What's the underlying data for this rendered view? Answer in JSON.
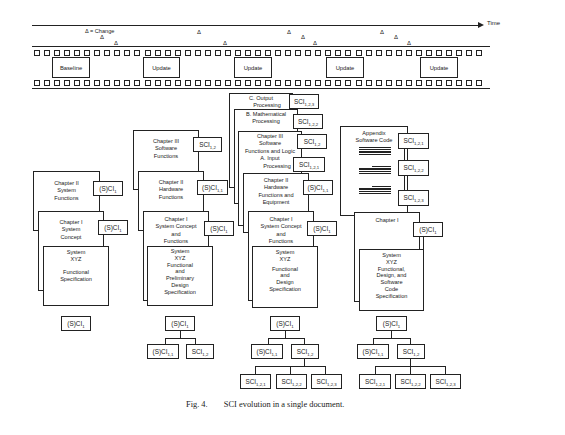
{
  "timeline": {
    "axis_label": "Time",
    "legend": "Δ = Change",
    "change_marker": "Δ",
    "frames": [
      {
        "label": "Baseline"
      },
      {
        "label": "Update"
      },
      {
        "label": "Update"
      },
      {
        "label": "Update"
      },
      {
        "label": "Update"
      }
    ]
  },
  "columns": [
    {
      "id": "baseline",
      "pages": [
        {
          "title": "Chapter II",
          "lines": [
            "System",
            "Functions"
          ],
          "sci": "(S)CI",
          "sub": "1"
        },
        {
          "title": "Chapter I",
          "lines": [
            "System",
            "Concept"
          ],
          "sci": "(S)CI",
          "sub": "1"
        },
        {
          "title": "System",
          "lines": [
            "XYZ",
            "",
            "Functional",
            "Specification"
          ]
        }
      ],
      "tree": {
        "root": {
          "label": "(S)CI",
          "sub": "1"
        }
      }
    },
    {
      "id": "update1",
      "pages": [
        {
          "title": "Chapter III",
          "lines": [
            "Software",
            "Functions"
          ],
          "sci": "SCI",
          "sub": "1,2"
        },
        {
          "title": "Chapter II",
          "lines": [
            "Hardware",
            "Functions"
          ],
          "sci": "(S)CI",
          "sub": "1,1"
        },
        {
          "title": "Chapter I",
          "lines": [
            "System Concept",
            "and",
            "Functions"
          ],
          "sci": "(S)CI",
          "sub": "1"
        },
        {
          "title": "System",
          "lines": [
            "XYZ",
            "Functional",
            "and",
            "Preliminary",
            "Design",
            "Specification"
          ]
        }
      ],
      "tree": {
        "root": {
          "label": "(S)CI",
          "sub": "1"
        },
        "children": [
          {
            "label": "(S)CI",
            "sub": "1,1"
          },
          {
            "label": "SCI",
            "sub": "1,2"
          }
        ]
      }
    },
    {
      "id": "update2",
      "pages": [
        {
          "title": "C. Output",
          "lines": [
            "Processing"
          ],
          "sci": "SCI",
          "sub": "1,2,3"
        },
        {
          "title": "B. Mathematical",
          "lines": [
            "Processing"
          ],
          "sci": "SCI",
          "sub": "1,2,2"
        },
        {
          "title": "Chapter III",
          "lines": [
            "Software",
            "Functions and Logic"
          ],
          "sci": "SCI",
          "sub": "1,2"
        },
        {
          "title": "A. Input",
          "lines": [
            "Processing"
          ],
          "sci": "SCI",
          "sub": "1,2,1"
        },
        {
          "title": "Chapter II",
          "lines": [
            "Hardware",
            "Functions and",
            "Equipment"
          ],
          "sci": "(S)CI",
          "sub": "1,1"
        },
        {
          "title": "Chapter I",
          "lines": [
            "System Concept",
            "and",
            "Functions"
          ],
          "sci": "(S)CI",
          "sub": "1"
        },
        {
          "title": "System",
          "lines": [
            "XYZ",
            "",
            "Functional",
            "and",
            "Design",
            "Specification"
          ]
        }
      ],
      "tree": {
        "root": {
          "label": "(S)CI",
          "sub": "1"
        },
        "children": [
          {
            "label": "(S)CI",
            "sub": "1,1"
          },
          {
            "label": "SCI",
            "sub": "1,2"
          }
        ],
        "grandchildren": [
          {
            "label": "SCI",
            "sub": "1,2,1"
          },
          {
            "label": "SCI",
            "sub": "1,2,2"
          },
          {
            "label": "SCI",
            "sub": "1,2,3"
          }
        ]
      }
    },
    {
      "id": "update3",
      "pages": [
        {
          "title": "Appendix",
          "lines": [
            "Software Code"
          ],
          "sci_list": [
            {
              "label": "SCI",
              "sub": "1,2,1"
            },
            {
              "label": "SCI",
              "sub": "1,2,2"
            },
            {
              "label": "SCI",
              "sub": "1,2,3"
            }
          ]
        },
        {
          "title": "Chapter I",
          "lines": [],
          "sci": "(S)CI",
          "sub": "1"
        },
        {
          "title": "System",
          "lines": [
            "XYZ",
            "Functional,",
            "Design, and",
            "Software",
            "Code",
            "Specification"
          ]
        }
      ],
      "tree": {
        "root": {
          "label": "(S)CI",
          "sub": "1"
        },
        "children": [
          {
            "label": "(S)CI",
            "sub": "1,1"
          },
          {
            "label": "SCI",
            "sub": "1,2"
          }
        ],
        "grandchildren": [
          {
            "label": "SCI",
            "sub": "1,2,1"
          },
          {
            "label": "SCI",
            "sub": "1,2,2"
          },
          {
            "label": "SCI",
            "sub": "1,2,3"
          }
        ]
      }
    }
  ],
  "caption": {
    "fig": "Fig. 4.",
    "text": "SCI evolution in a single document."
  }
}
